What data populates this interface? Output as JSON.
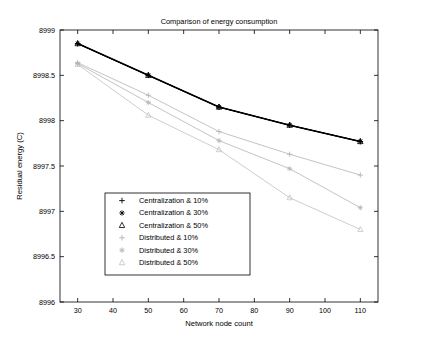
{
  "chart_data": {
    "type": "line",
    "title": "Comparison of energy consumption",
    "xlabel": "Network node count",
    "ylabel": "Residual energy (C)",
    "xlim": [
      25,
      115
    ],
    "ylim": [
      8996,
      8999
    ],
    "xticks": [
      30,
      40,
      50,
      60,
      70,
      80,
      90,
      100,
      110
    ],
    "yticks": [
      8996,
      8996.5,
      8997,
      8997.5,
      8998,
      8998.5,
      8999
    ],
    "ytick_labels": [
      "8996",
      "8996.5",
      "8997",
      "8997.5",
      "8998",
      "8998.5",
      "8999"
    ],
    "xtick_labels": [
      "30",
      "40",
      "50",
      "60",
      "70",
      "80",
      "90",
      "100",
      "110"
    ],
    "grid": false,
    "legend_position": "lower-left-inside",
    "x": [
      30,
      50,
      70,
      90,
      110
    ],
    "series": [
      {
        "name": "Centralization & 10%",
        "marker": "plus",
        "color": "#000000",
        "width": 1.0,
        "values": [
          8998.85,
          8998.5,
          8998.15,
          8997.95,
          8997.77
        ]
      },
      {
        "name": "Centralization & 30%",
        "marker": "star",
        "color": "#000000",
        "width": 1.6,
        "values": [
          8998.85,
          8998.5,
          8998.15,
          8997.95,
          8997.77
        ]
      },
      {
        "name": "Centralization & 50%",
        "marker": "triangle",
        "color": "#000000",
        "width": 1.0,
        "values": [
          8998.85,
          8998.5,
          8998.15,
          8997.95,
          8997.77
        ]
      },
      {
        "name": "Distributed & 10%",
        "marker": "plus",
        "color": "#b4b4b4",
        "width": 0.8,
        "values": [
          8998.64,
          8998.28,
          8997.88,
          8997.63,
          8997.4
        ]
      },
      {
        "name": "Distributed & 30%",
        "marker": "star",
        "color": "#b4b4b4",
        "width": 0.8,
        "values": [
          8998.63,
          8998.2,
          8997.78,
          8997.47,
          8997.04
        ]
      },
      {
        "name": "Distributed & 50%",
        "marker": "triangle",
        "color": "#c0c0c0",
        "width": 0.8,
        "values": [
          8998.62,
          8998.06,
          8997.68,
          8997.15,
          8996.8
        ]
      }
    ],
    "legend_entries": [
      {
        "label": "Centralization & 10%",
        "marker": "plus",
        "color": "#000000"
      },
      {
        "label": "Centralization & 30%",
        "marker": "star",
        "color": "#000000"
      },
      {
        "label": "Centralization & 50%",
        "marker": "triangle",
        "color": "#000000"
      },
      {
        "label": "Distributed & 10%",
        "marker": "plus",
        "color": "#b4b4b4"
      },
      {
        "label": "Distributed & 30%",
        "marker": "star",
        "color": "#b4b4b4"
      },
      {
        "label": "Distributed & 50%",
        "marker": "triangle",
        "color": "#c0c0c0"
      }
    ]
  }
}
